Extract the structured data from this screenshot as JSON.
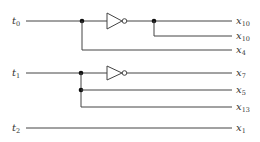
{
  "diagram": {
    "type": "logic-circuit",
    "inputs": [
      {
        "id": "t0",
        "base": "t",
        "sub": "0"
      },
      {
        "id": "t1",
        "base": "t",
        "sub": "1"
      },
      {
        "id": "t2",
        "base": "t",
        "sub": "2"
      }
    ],
    "outputs": [
      {
        "id": "o1",
        "base": "x",
        "sub": "10"
      },
      {
        "id": "o2",
        "base": "x",
        "sub": "10"
      },
      {
        "id": "o3",
        "base": "x",
        "sub": "4"
      },
      {
        "id": "o4",
        "base": "x",
        "sub": "7"
      },
      {
        "id": "o5",
        "base": "x",
        "sub": "5"
      },
      {
        "id": "o6",
        "base": "x",
        "sub": "13"
      },
      {
        "id": "o7",
        "base": "x",
        "sub": "1"
      }
    ],
    "gates": [
      {
        "id": "inv1",
        "kind": "inverter",
        "input": "t0"
      },
      {
        "id": "inv2",
        "kind": "inverter",
        "input": "t1"
      }
    ],
    "connections": [
      {
        "from": "t0",
        "via": "inv1",
        "to": "x10"
      },
      {
        "from": "t0",
        "via": "inv1",
        "to": "x10"
      },
      {
        "from": "t0",
        "to": "x4"
      },
      {
        "from": "t1",
        "via": "inv2",
        "to": "x7"
      },
      {
        "from": "t1",
        "to": "x5"
      },
      {
        "from": "t1",
        "to": "x13"
      },
      {
        "from": "t2",
        "to": "x1"
      }
    ],
    "colors": {
      "wire": "#444444",
      "junction": "#111111",
      "background": "#ffffff"
    }
  }
}
